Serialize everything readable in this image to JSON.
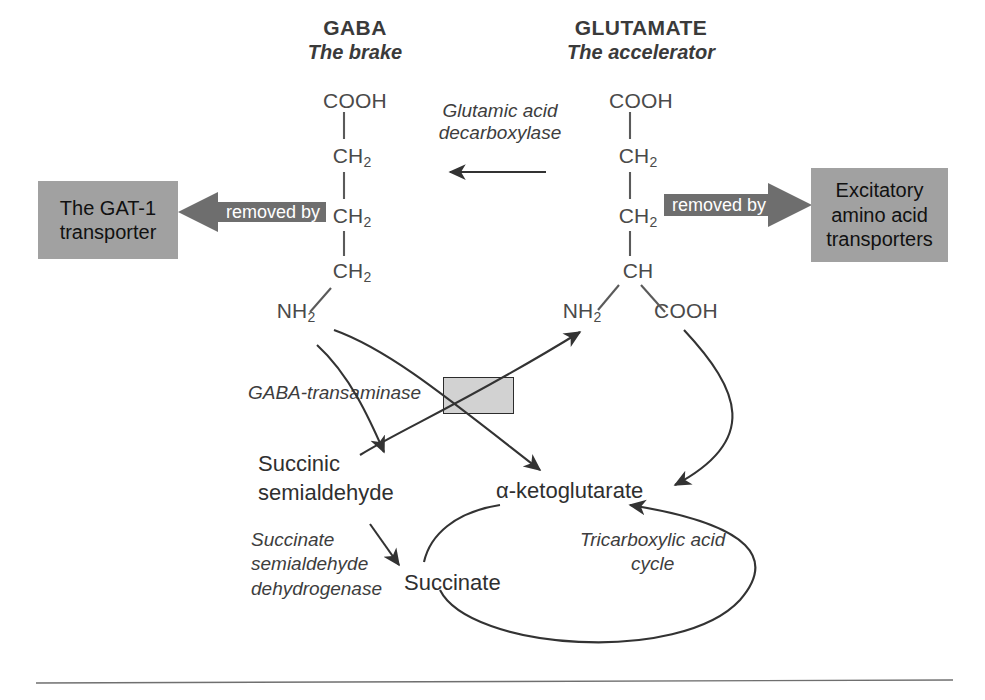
{
  "figure": {
    "colors": {
      "box_fill": "#a1a1a1",
      "arrow_fill": "#6e6e6e",
      "arrow_text": "#ffffff",
      "crossbox_fill": "#d2d2d2",
      "line": "#333333",
      "bond": "#5a5a5a",
      "text": "#333333"
    }
  },
  "headers": {
    "gaba": {
      "name": "GABA",
      "subtitle": "The brake"
    },
    "glutamate": {
      "name": "GLUTAMATE",
      "subtitle": "The accelerator"
    }
  },
  "gaba_structure": {
    "c1": "COOH",
    "c2": "CH",
    "c2_sub": "2",
    "c3": "CH",
    "c3_sub": "2",
    "c4": "CH",
    "c4_sub": "2",
    "amine": "NH",
    "amine_sub": "2"
  },
  "glutamate_structure": {
    "c1": "COOH",
    "c2": "CH",
    "c2_sub": "2",
    "c3": "CH",
    "c3_sub": "2",
    "c4": "CH",
    "amine": "NH",
    "amine_sub": "2",
    "acid": "COOH"
  },
  "enzymes": {
    "gad": "Glutamic acid\ndecarboxylase",
    "gaba_t": "GABA-transaminase",
    "ssadh": "Succinate\nsemialdehyde\ndehydrogenase",
    "tca": "Tricarboxylic acid\ncycle"
  },
  "transporters": {
    "gat1": {
      "label": "The GAT-1\ntransporter",
      "arrow_label": "removed by"
    },
    "eaat": {
      "label": "Excitatory\namino acid\ntransporters",
      "arrow_label": "removed by"
    }
  },
  "metabolites": {
    "succinic_semialdehyde": "Succinic\nsemialdehyde",
    "succinate": "Succinate",
    "alpha_ketoglutarate": "α-ketoglutarate"
  }
}
